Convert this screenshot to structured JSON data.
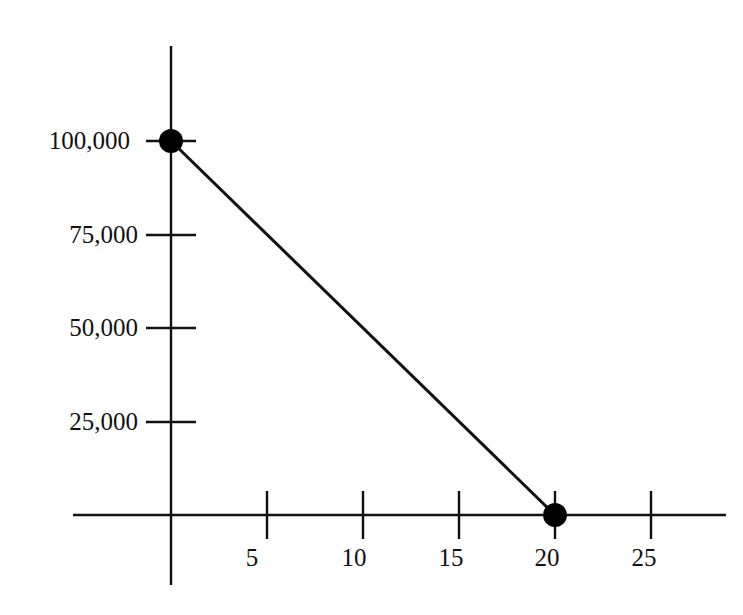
{
  "chart_data": {
    "type": "line",
    "title": "",
    "xlabel": "",
    "ylabel": "",
    "x": [
      0,
      20
    ],
    "series": [
      {
        "name": "line",
        "values": [
          100000,
          0
        ]
      }
    ],
    "points": [
      {
        "x": 0,
        "y": 100000
      },
      {
        "x": 20,
        "y": 0
      }
    ],
    "xlim": [
      -5,
      29
    ],
    "ylim": [
      -26000,
      125000
    ],
    "x_ticks": [
      5,
      10,
      15,
      20,
      25
    ],
    "x_tick_labels": [
      "5",
      "10",
      "15",
      "20",
      "25"
    ],
    "y_ticks": [
      25000,
      50000,
      75000,
      100000
    ],
    "y_tick_labels": [
      "25,000",
      "50,000",
      "75,000",
      "100,000"
    ],
    "grid": false,
    "legend": null,
    "markers": "filled-circle",
    "colors": {
      "line": "#111111",
      "marker": "#000000",
      "background": "#ffffff"
    }
  },
  "axes": {
    "x_tick_labels": [
      "5",
      "10",
      "15",
      "20",
      "25"
    ],
    "y_tick_labels": [
      "25,000",
      "50,000",
      "75,000",
      "100,000"
    ]
  }
}
